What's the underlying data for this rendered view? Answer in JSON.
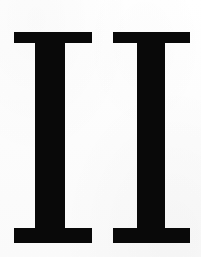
{
  "image": {
    "kind": "scanned-page-fragment",
    "content_text": "II",
    "description": "Roman numeral two rendered as two bold serif capital I letterforms",
    "width": 201,
    "height": 257,
    "background_color": "#fdfdfd",
    "ink_color": "#090909"
  },
  "numeral": {
    "value": "II",
    "reading": "2",
    "style": "bold slab-serif capital",
    "glyphs": [
      {
        "character": "I",
        "index": 1,
        "name": "first-i",
        "serif_left": 14,
        "serif_right": 92,
        "stem_left": 35,
        "stem_right": 65,
        "top": 32,
        "bottom": 243,
        "top_serif_bottom": 43,
        "bottom_serif_top": 228
      },
      {
        "character": "I",
        "index": 2,
        "name": "second-i",
        "serif_left": 113,
        "serif_right": 190,
        "stem_left": 137,
        "stem_right": 165,
        "top": 32,
        "bottom": 243,
        "top_serif_bottom": 43,
        "bottom_serif_top": 228
      }
    ]
  }
}
